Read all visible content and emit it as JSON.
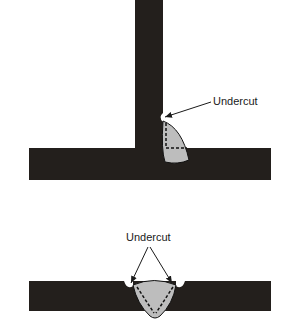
{
  "figure": {
    "top_diagram": {
      "name": "fillet-weld-t-joint",
      "label": "Undercut"
    },
    "bottom_diagram": {
      "name": "groove-weld-butt-joint",
      "label": "Undercut"
    }
  },
  "colors": {
    "metal": "#231f1c",
    "weld": "#bdbdbd",
    "line": "#1a1a1a",
    "background": "#ffffff"
  }
}
